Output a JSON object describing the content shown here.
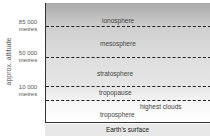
{
  "diagram": {
    "axis_label": "approx. altitude",
    "ticks": [
      {
        "value": "85 000",
        "unit": "metres"
      },
      {
        "value": "50 000",
        "unit": "metres"
      },
      {
        "value": "10 000",
        "unit": "metres"
      }
    ],
    "layers": [
      {
        "name": "ionosphere"
      },
      {
        "name": "mesosphere"
      },
      {
        "name": "stratosphere"
      },
      {
        "name": "tropopause"
      },
      {
        "name": "troposphere"
      }
    ],
    "annotation": "highest clouds",
    "surface_label": "Earth's surface"
  }
}
